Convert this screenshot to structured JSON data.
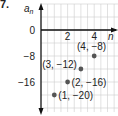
{
  "problem_number": "7.",
  "chart_data": {
    "type": "scatter",
    "title": "",
    "xlabel": "n",
    "ylabel": "a_n",
    "x_ticks": [
      2,
      4
    ],
    "y_ticks": [
      0,
      -8,
      -16
    ],
    "xlim": [
      0,
      5
    ],
    "ylim": [
      -22,
      6
    ],
    "grid": true,
    "points": [
      {
        "x": 1,
        "y": -20,
        "label": "(1, −20)"
      },
      {
        "x": 2,
        "y": -16,
        "label": "(2, −16)"
      },
      {
        "x": 3,
        "y": -12,
        "label": "(3, −12)"
      },
      {
        "x": 4,
        "y": -8,
        "label": "(4, −8)"
      }
    ],
    "colors": {
      "point": "#555555",
      "grid": "#cccccc",
      "axis": "#111111"
    }
  }
}
